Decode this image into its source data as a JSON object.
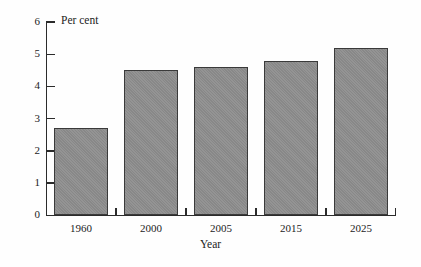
{
  "chart_data": {
    "type": "bar",
    "title": "",
    "subtitle": "",
    "categories": [
      "1960",
      "2000",
      "2005",
      "2015",
      "2025"
    ],
    "values": [
      2.7,
      4.5,
      4.6,
      4.8,
      5.2
    ],
    "xlabel": "Year",
    "ylabel": "Per cent",
    "ylim": [
      0,
      6
    ],
    "yticks": [
      0,
      1,
      2,
      3,
      4,
      5,
      6
    ],
    "ytick_labels": [
      "0",
      "1",
      "2",
      "3",
      "4",
      "5",
      "6"
    ],
    "grid": false,
    "legend": null,
    "annotations": [],
    "series": [
      {
        "name": "Per cent",
        "values": [
          2.7,
          4.5,
          4.6,
          4.8,
          5.2
        ]
      }
    ],
    "colors": {
      "bar_fill": "#8e8e8e",
      "bar_border": "#3a3a3a",
      "axis": "#2b2b2b",
      "text": "#1c1c1c",
      "background": "#fefefe"
    }
  }
}
